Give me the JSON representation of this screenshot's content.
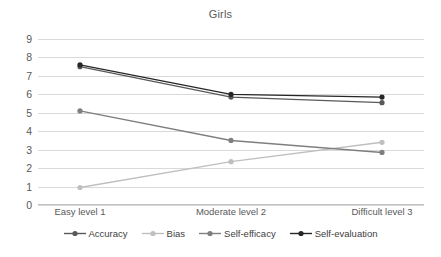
{
  "chart_data": {
    "type": "line",
    "title": "Girls",
    "xlabel": "",
    "ylabel": "",
    "ylim": [
      0,
      9
    ],
    "yticks": [
      9,
      8,
      7,
      6,
      5,
      4,
      3,
      2,
      1,
      0
    ],
    "grid": true,
    "legend_position": "bottom",
    "categories": [
      "Easy level 1",
      "Moderate level 2",
      "Difficult level 3"
    ],
    "series": [
      {
        "name": "Accuracy",
        "values": [
          7.5,
          5.85,
          5.55
        ],
        "color": "#595959",
        "marker": "circle"
      },
      {
        "name": "Bias",
        "values": [
          0.95,
          2.35,
          3.4
        ],
        "color": "#bfbfbf",
        "marker": "circle"
      },
      {
        "name": "Self-efficacy",
        "values": [
          5.1,
          3.5,
          2.85
        ],
        "color": "#7f7f7f",
        "marker": "circle"
      },
      {
        "name": "Self-evaluation",
        "values": [
          7.6,
          6.0,
          5.85
        ],
        "color": "#262626",
        "marker": "circle"
      }
    ]
  },
  "colors": {
    "gridline": "#d9d9d9",
    "axis": "#bfbfbf",
    "text": "#595959",
    "background": "#ffffff"
  }
}
